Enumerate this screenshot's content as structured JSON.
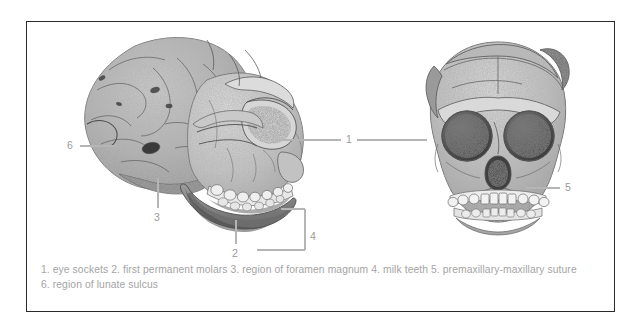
{
  "figure": {
    "frame_color": "#2b2b2b",
    "background_color": "#ffffff",
    "label_color": "#9a9a9a",
    "caption_color": "#a4a4a4",
    "leader_line_color": "#b5b5b5"
  },
  "illustrations": [
    {
      "name": "skull-lateral",
      "view": "lateral",
      "description": "stippled ink drawing of a juvenile hominin skull in left lateral view showing endocast, brow, orbit, maxilla and mandible with erupting dentition"
    },
    {
      "name": "skull-frontal",
      "view": "frontal",
      "description": "stippled ink drawing of the same skull in frontal view showing two large orbits, nasal aperture and upper and lower tooth rows"
    }
  ],
  "callouts": [
    {
      "id": "1",
      "number": "1",
      "target": "eye sockets",
      "leader": "horizontal-both"
    },
    {
      "id": "2",
      "number": "2",
      "target": "first permanent molars",
      "leader": "vertical-up"
    },
    {
      "id": "3",
      "number": "3",
      "target": "region of foramen magnum",
      "leader": "vertical-up"
    },
    {
      "id": "4",
      "number": "4",
      "target": "milk teeth",
      "leader": "bracket-left"
    },
    {
      "id": "5",
      "number": "5",
      "target": "premaxillary-maxillary suture",
      "leader": "horizontal-left"
    },
    {
      "id": "6",
      "number": "6",
      "target": "region of lunate sulcus",
      "leader": "horizontal-right"
    }
  ],
  "caption": {
    "line1": "1. eye sockets 2. first permanent molars 3. region of foramen magnum 4. milk teeth 5. premaxillary-maxillary suture",
    "line2": "6. region of lunate sulcus"
  }
}
